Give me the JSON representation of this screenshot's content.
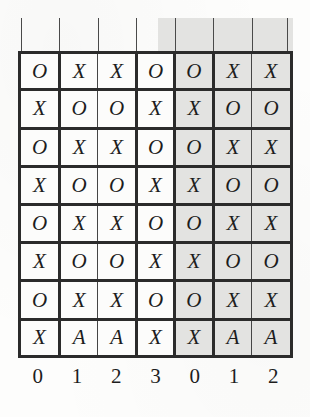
{
  "figure": {
    "kind": "grid-diagram",
    "rows": 8,
    "cols": 7,
    "ink_color": "#2b2b2b",
    "shade_color": "#e3e3e1",
    "paper_color": "#fdfdfc"
  },
  "grid": {
    "cells": [
      [
        "O",
        "X",
        "X",
        "O",
        "O",
        "X",
        "X"
      ],
      [
        "X",
        "O",
        "O",
        "X",
        "X",
        "O",
        "O"
      ],
      [
        "O",
        "X",
        "X",
        "O",
        "O",
        "X",
        "X"
      ],
      [
        "X",
        "O",
        "O",
        "X",
        "X",
        "O",
        "O"
      ],
      [
        "O",
        "X",
        "X",
        "O",
        "O",
        "X",
        "X"
      ],
      [
        "X",
        "O",
        "O",
        "X",
        "X",
        "O",
        "O"
      ],
      [
        "O",
        "X",
        "X",
        "O",
        "O",
        "X",
        "X"
      ],
      [
        "X",
        "A",
        "A",
        "X",
        "X",
        "A",
        "A"
      ]
    ],
    "row_rules": [
      "thick",
      "thick",
      "thick",
      "thick",
      "thick",
      "thick",
      "thick",
      "none"
    ],
    "col_rules": [
      "thick",
      "thin",
      "thick",
      "thick",
      "thick",
      "thin",
      "none"
    ],
    "shaded_columns": [
      4,
      5,
      6
    ]
  },
  "axis": {
    "column_labels": [
      "0",
      "1",
      "2",
      "3",
      "0",
      "1",
      "2"
    ]
  },
  "risers": {
    "count": 8,
    "label": "column-tick-riser"
  }
}
